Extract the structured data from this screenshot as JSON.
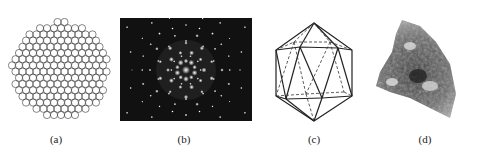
{
  "figure": {
    "panels": [
      {
        "id": "a",
        "label": "(a)",
        "description": "quasicrystal tiling (Penrose-like pattern)"
      },
      {
        "id": "b",
        "label": "(b)",
        "description": "diffraction pattern with tenfold symmetry"
      },
      {
        "id": "c",
        "label": "(c)",
        "description": "icosahedron wireframe"
      },
      {
        "id": "d",
        "label": "(d)",
        "description": "mineral sample photograph"
      }
    ]
  },
  "colors": {
    "background": "#ffffff",
    "diffraction_bg": "#111111",
    "line": "#222222"
  }
}
